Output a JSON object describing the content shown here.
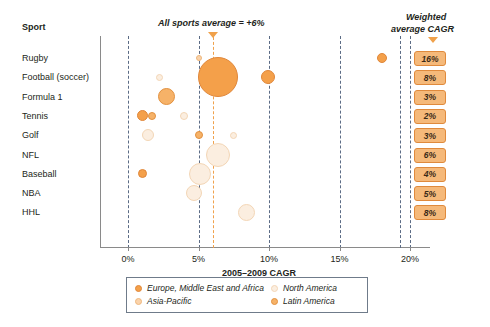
{
  "chart_data": {
    "type": "scatter",
    "title": "",
    "xlabel": "2005–2009 CAGR",
    "ylabel": "Sport",
    "xlim": [
      -2,
      21
    ],
    "xticks": [
      "0%",
      "5%",
      "10%",
      "15%",
      "20%"
    ],
    "xtickvalues": [
      0,
      5,
      10,
      15,
      20
    ],
    "grid": true,
    "legend_position": "bottom",
    "annotation": "All sports average = +6%",
    "average_value": 6,
    "categories": [
      "Rugby",
      "Football (soccer)",
      "Formula 1",
      "Tennis",
      "Golf",
      "NFL",
      "Baseball",
      "NBA",
      "HHL"
    ],
    "weighted_average_cagr": [
      "16%",
      "8%",
      "3%",
      "2%",
      "3%",
      "6%",
      "4%",
      "5%",
      "8%"
    ],
    "series": [
      {
        "name": "Europe, Middle East and Africa",
        "color": "#f4a04a"
      },
      {
        "name": "North America",
        "color": "#fbeee0"
      },
      {
        "name": "Asia-Pacific",
        "color": "#fad3ab"
      },
      {
        "name": "Latin America",
        "color": "#f6b268"
      }
    ],
    "points": [
      {
        "sport": "Rugby",
        "x": 5.0,
        "r": 3,
        "region": "Asia-Pacific"
      },
      {
        "sport": "Rugby",
        "x": 18.0,
        "r": 5,
        "region": "Europe, Middle East and Africa"
      },
      {
        "sport": "Football (soccer)",
        "x": 6.4,
        "r": 20,
        "region": "Europe, Middle East and Africa"
      },
      {
        "sport": "Football (soccer)",
        "x": 9.9,
        "r": 7,
        "region": "Europe, Middle East and Africa"
      },
      {
        "sport": "Football (soccer)",
        "x": 2.2,
        "r": 3.5,
        "region": "North America"
      },
      {
        "sport": "Formula 1",
        "x": 2.7,
        "r": 8.5,
        "region": "Latin America"
      },
      {
        "sport": "Tennis",
        "x": 1.0,
        "r": 5.5,
        "region": "Europe, Middle East and Africa"
      },
      {
        "sport": "Tennis",
        "x": 1.7,
        "r": 4,
        "region": "Latin America"
      },
      {
        "sport": "Tennis",
        "x": 4.0,
        "r": 4,
        "region": "North America"
      },
      {
        "sport": "Golf",
        "x": 1.4,
        "r": 6,
        "region": "North America"
      },
      {
        "sport": "Golf",
        "x": 5.0,
        "r": 4,
        "region": "Latin America"
      },
      {
        "sport": "Golf",
        "x": 7.5,
        "r": 3.5,
        "region": "North America"
      },
      {
        "sport": "NFL",
        "x": 6.4,
        "r": 12,
        "region": "North America"
      },
      {
        "sport": "Baseball",
        "x": 1.0,
        "r": 4.5,
        "region": "Europe, Middle East and Africa"
      },
      {
        "sport": "Baseball",
        "x": 5.1,
        "r": 11,
        "region": "North America"
      },
      {
        "sport": "NBA",
        "x": 4.7,
        "r": 8,
        "region": "North America"
      },
      {
        "sport": "HHL",
        "x": 8.4,
        "r": 8.5,
        "region": "North America"
      }
    ]
  },
  "header": {
    "sport_column": "Sport",
    "cagr_column_line1": "Weighted",
    "cagr_column_line2": "average CAGR"
  },
  "legend": {
    "items": [
      {
        "label": "Europe, Middle East and Africa",
        "color": "#f4a04a"
      },
      {
        "label": "Asia-Pacific",
        "color": "#fad3ab"
      },
      {
        "label": "North America",
        "color": "#fbeee0"
      },
      {
        "label": "Latin America",
        "color": "#f6b268"
      }
    ]
  },
  "colors": {
    "emea": "#f4a04a",
    "north_america": "#fbeee0",
    "asia_pacific": "#fad3ab",
    "latin_america": "#f6b268",
    "grid": "#5b6b85",
    "average_line": "#f0a14b",
    "badge_bg": "#f5b97a",
    "badge_border": "#e08a3c"
  }
}
